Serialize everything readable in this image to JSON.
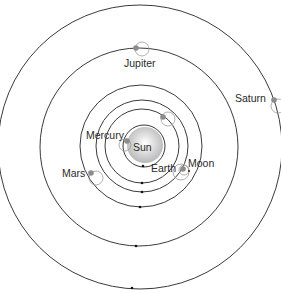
{
  "diagram": {
    "type": "geocentric-planetary-orbits",
    "center": {
      "x": 141,
      "y": 147
    },
    "colors": {
      "orbit": "#3a3a3a",
      "planet": "#8c8c8c",
      "sun_light": "#ffffff",
      "sun_dark": "#b8b8b8",
      "epicycle": "#9a9a9a",
      "label": "#2a2a2a"
    },
    "labels": {
      "sun": "Sun",
      "earth": "Earth",
      "moon": "Moon",
      "mercury": "Mercury",
      "mars": "Mars",
      "jupiter": "Jupiter",
      "saturn": "Saturn"
    },
    "bodies": [
      {
        "name": "Sun",
        "x": 145,
        "y": 145,
        "r": 17
      },
      {
        "name": "Mercury",
        "x": 127,
        "y": 141
      },
      {
        "name": "Venus",
        "x": 163,
        "y": 117
      },
      {
        "name": "Moon",
        "x": 183,
        "y": 169
      },
      {
        "name": "Mars",
        "x": 91,
        "y": 173
      },
      {
        "name": "Jupiter",
        "x": 136,
        "y": 48
      },
      {
        "name": "Saturn",
        "x": 274,
        "y": 100
      }
    ],
    "orbits": [
      {
        "name": "sun-ring",
        "r": 21
      },
      {
        "name": "mercury-ring",
        "r": 37
      },
      {
        "name": "venus-ring",
        "r": 46
      },
      {
        "name": "mars-ring",
        "r": 61
      },
      {
        "name": "jupiter-ring",
        "r": 99
      },
      {
        "name": "saturn-ring",
        "r": 142
      }
    ]
  }
}
